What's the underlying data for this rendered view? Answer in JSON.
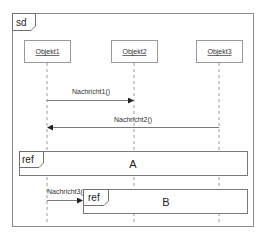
{
  "diagram": {
    "type": "sequence",
    "frame_label": "sd",
    "objects": [
      {
        "name": "Objekt1",
        "x": 47
      },
      {
        "name": "Objekt2",
        "x": 134
      },
      {
        "name": "Objekt3",
        "x": 219
      }
    ],
    "messages": [
      {
        "label": "Nachricht1()",
        "from": "Objekt1",
        "to": "Objekt2"
      },
      {
        "label": "Nachricht2()",
        "from": "Objekt3",
        "to": "Objekt1"
      },
      {
        "label": "Nachricht3(",
        "from": "Objekt1",
        "to": "ref B"
      }
    ],
    "fragments": [
      {
        "operator": "ref",
        "name": "A"
      },
      {
        "operator": "ref",
        "name": "B"
      }
    ],
    "colors": {
      "line": "#8a8a8a",
      "text": "#333333",
      "background": "#ffffff"
    }
  }
}
